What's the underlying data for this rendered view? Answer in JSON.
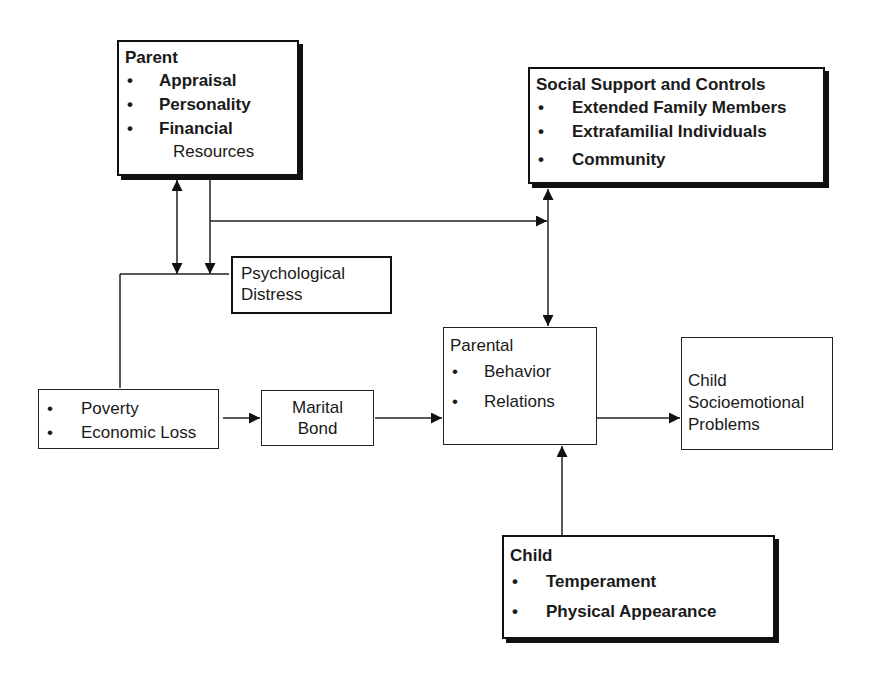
{
  "diagram": {
    "nodes": {
      "parent": {
        "title": "Parent",
        "items": [
          "Appraisal",
          "Personality",
          "Financial"
        ],
        "item_continuation": "Resources"
      },
      "social_support": {
        "title": "Social Support and Controls",
        "items": [
          "Extended Family Members",
          "Extrafamilial Individuals",
          "Community"
        ]
      },
      "psychological_distress": {
        "line1": "Psychological",
        "line2": "Distress"
      },
      "economic": {
        "items": [
          "Poverty",
          "Economic Loss"
        ]
      },
      "marital_bond": {
        "line1": "Marital",
        "line2": "Bond"
      },
      "parental": {
        "title": "Parental",
        "items": [
          "Behavior",
          "Relations"
        ]
      },
      "child_outcome": {
        "line1": "Child",
        "line2": "Socioemotional",
        "line3": "Problems"
      },
      "child": {
        "title": "Child",
        "items": [
          "Temperament",
          "Physical Appearance"
        ]
      }
    },
    "bullet": "•",
    "edges": [
      {
        "from": "parent",
        "to": "psychological_distress",
        "type": "bidirectional"
      },
      {
        "from": "parent",
        "to": "psychological_distress",
        "type": "directed"
      },
      {
        "from": "parent",
        "to": "social_support",
        "type": "directed"
      },
      {
        "from": "economic",
        "to": "psychological_distress",
        "type": "line"
      },
      {
        "from": "economic",
        "to": "marital_bond",
        "type": "directed"
      },
      {
        "from": "marital_bond",
        "to": "parental",
        "type": "directed"
      },
      {
        "from": "social_support",
        "to": "parental",
        "type": "bidirectional"
      },
      {
        "from": "parental",
        "to": "child_outcome",
        "type": "directed"
      },
      {
        "from": "child",
        "to": "parental",
        "type": "directed"
      }
    ]
  }
}
